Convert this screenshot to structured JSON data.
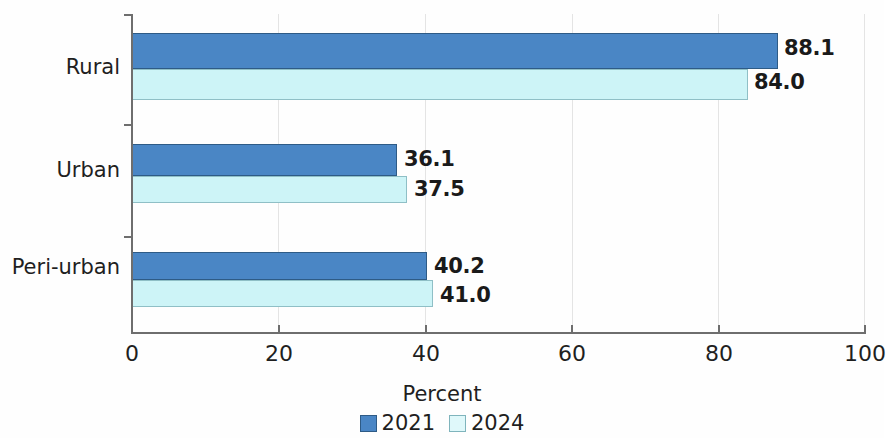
{
  "chart_data": {
    "type": "bar",
    "orientation": "horizontal",
    "title": "",
    "xlabel": "Percent",
    "ylabel": "",
    "xlim": [
      0,
      100
    ],
    "xticks": [
      "0",
      "20",
      "40",
      "60",
      "80",
      "100"
    ],
    "grid": true,
    "legend_position": "bottom",
    "categories": [
      "Rural",
      "Urban",
      "Peri-urban"
    ],
    "series": [
      {
        "name": "2021",
        "color": "#4a86c5",
        "values": [
          88.1,
          36.1,
          40.2
        ],
        "labels": [
          "88.1",
          "36.1",
          "40.2"
        ]
      },
      {
        "name": "2024",
        "color": "#cdf4f7",
        "values": [
          84.0,
          37.5,
          41.0
        ],
        "labels": [
          "84.0",
          "37.5",
          "41.0"
        ]
      }
    ]
  }
}
